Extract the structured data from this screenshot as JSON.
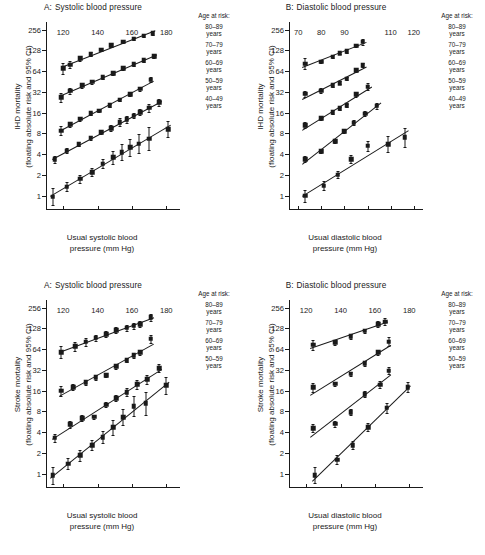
{
  "figure": {
    "legend_title": "Age at risk:",
    "axis_note": "floating absolute risk and 95% CI"
  },
  "chart_data": [
    {
      "id": "ihd-systolic",
      "type": "scatter",
      "panel_letter": "A:",
      "title": "Systolic blood pressure",
      "xlabel_line1": "Usual systolic blood",
      "xlabel_line2": "pressure (mm Hg)",
      "ylabel_line1": "IHD mortality",
      "ylabel_line2": "(floating absolute risk and 95% CI)",
      "yscale": "log2",
      "yticks": [
        1,
        2,
        4,
        8,
        16,
        32,
        64,
        128,
        256
      ],
      "ylim": [
        0.62,
        330
      ],
      "xticks": [
        120,
        140,
        160,
        180
      ],
      "xlim": [
        110,
        188
      ],
      "legend_title": "Age at risk:",
      "grid": false,
      "legend_position": "right",
      "series": [
        {
          "name": "80-89 years",
          "label_line1": "80–89",
          "label_line2": "years",
          "x": [
            120,
            124,
            130,
            136,
            142,
            148,
            155,
            161,
            167,
            172
          ],
          "y": [
            70,
            79,
            98,
            113,
            131,
            152,
            172,
            190,
            208,
            228
          ],
          "ci_lo": [
            58,
            70,
            90,
            106,
            124,
            145,
            165,
            182,
            198,
            216
          ],
          "ci_hi": [
            85,
            89,
            107,
            120,
            139,
            160,
            180,
            199,
            219,
            241
          ]
        },
        {
          "name": "70-79 years",
          "label_line1": "70–79",
          "label_line2": "years",
          "x": [
            119,
            124,
            131,
            137,
            143,
            149,
            155,
            161,
            167,
            173
          ],
          "y": [
            27,
            33,
            40,
            45,
            52,
            60,
            70,
            80,
            92,
            105
          ],
          "ci_lo": [
            23,
            30,
            37,
            42,
            49,
            57,
            67,
            77,
            88,
            100
          ],
          "ci_hi": [
            31,
            36,
            43,
            48,
            55,
            63,
            73,
            83,
            96,
            110
          ]
        },
        {
          "name": "60-69 years",
          "label_line1": "60–69",
          "label_line2": "years",
          "x": [
            119,
            124,
            130,
            136,
            141,
            147,
            153,
            159,
            165,
            171
          ],
          "y": [
            8.8,
            10.8,
            13.0,
            15.8,
            17.0,
            20.5,
            24.5,
            29.5,
            35.5,
            48
          ],
          "ci_lo": [
            7.6,
            10.0,
            12.3,
            15.0,
            16.3,
            19.6,
            23.4,
            28.0,
            33.2,
            44
          ],
          "ci_hi": [
            10.1,
            11.6,
            13.7,
            16.6,
            17.8,
            21.4,
            25.6,
            31.0,
            38.0,
            52
          ]
        },
        {
          "name": "50-59 years",
          "label_line1": "50–59",
          "label_line2": "years",
          "x": [
            115,
            122,
            129,
            136,
            142,
            148,
            153,
            157,
            161,
            165,
            170,
            176
          ],
          "y": [
            3.4,
            4.5,
            5.6,
            6.9,
            8.3,
            9.5,
            11.6,
            12.8,
            14.5,
            16.2,
            18.8,
            22.5
          ],
          "ci_lo": [
            3.0,
            4.1,
            5.2,
            6.5,
            7.8,
            8.6,
            10.2,
            11.4,
            13.2,
            14.6,
            16.6,
            19.8
          ],
          "ci_hi": [
            3.8,
            4.9,
            6.0,
            7.3,
            8.8,
            10.5,
            13.2,
            14.4,
            16.0,
            18.0,
            21.3,
            25.6
          ]
        },
        {
          "name": "40-49 years",
          "label_line1": "40–49",
          "label_line2": "years",
          "x": [
            114,
            122,
            130,
            137,
            143,
            149,
            154,
            159,
            164,
            170,
            181
          ],
          "y": [
            0.97,
            1.35,
            1.75,
            2.2,
            2.9,
            3.6,
            4.3,
            5.0,
            5.7,
            6.7,
            9.2
          ],
          "ci_lo": [
            0.74,
            1.15,
            1.55,
            1.95,
            2.5,
            2.9,
            3.3,
            3.8,
            4.1,
            4.6,
            7.0
          ],
          "ci_hi": [
            1.28,
            1.6,
            1.98,
            2.5,
            3.4,
            4.5,
            5.6,
            6.6,
            7.9,
            9.8,
            12.1
          ]
        }
      ]
    },
    {
      "id": "ihd-diastolic",
      "type": "scatter",
      "panel_letter": "B:",
      "title": "Diastolic blood pressure",
      "xlabel_line1": "Usual diastolic blood",
      "xlabel_line2": "pressure (mm Hg)",
      "ylabel_line1": "IHD mortality",
      "ylabel_line2": "(floating absolute risk and 95% CI)",
      "yscale": "log2",
      "yticks": [
        1,
        2,
        4,
        8,
        16,
        32,
        64,
        128,
        256
      ],
      "ylim": [
        0.62,
        330
      ],
      "xticks": [
        70,
        80,
        90,
        110,
        120
      ],
      "xtick_positions": [
        70,
        80,
        90,
        110,
        120
      ],
      "xlim": [
        66,
        124
      ],
      "legend_title": "Age at risk:",
      "grid": false,
      "legend_position": "right",
      "series": [
        {
          "name": "80-89 years",
          "label_line1": "80–89",
          "label_line2": "years",
          "x": [
            73,
            80,
            85,
            88,
            91,
            95,
            98
          ],
          "y": [
            82,
            88,
            104,
            117,
            125,
            150,
            170
          ],
          "ci_lo": [
            68,
            83,
            99,
            112,
            119,
            142,
            155
          ],
          "ci_hi": [
            98,
            94,
            110,
            123,
            132,
            159,
            187
          ]
        },
        {
          "name": "70-79 years",
          "label_line1": "70–79",
          "label_line2": "years",
          "x": [
            73,
            80,
            85,
            88,
            91,
            95,
            98
          ],
          "y": [
            30,
            33,
            40,
            43,
            50,
            66,
            78
          ],
          "ci_lo": [
            27,
            31,
            38,
            41,
            47,
            62,
            73
          ],
          "ci_hi": [
            33,
            36,
            43,
            46,
            53,
            70,
            84
          ]
        },
        {
          "name": "60-69 years",
          "label_line1": "60–69",
          "label_line2": "years",
          "x": [
            73,
            80,
            85,
            88,
            91,
            95,
            100
          ],
          "y": [
            10.5,
            13.2,
            16.3,
            18.5,
            20.5,
            29.5,
            38
          ],
          "ci_lo": [
            9.5,
            12.4,
            15.4,
            17.5,
            19.4,
            27.4,
            34
          ],
          "ci_hi": [
            11.7,
            14.1,
            17.3,
            19.6,
            21.7,
            31.8,
            43
          ]
        },
        {
          "name": "50-59 years",
          "label_line1": "50–59",
          "label_line2": "years",
          "x": [
            73,
            80,
            86,
            90,
            94,
            99,
            104
          ],
          "y": [
            3.4,
            4.4,
            6.2,
            8.6,
            11.5,
            15.5,
            20
          ],
          "ci_lo": [
            3.1,
            4.1,
            5.8,
            8.0,
            10.6,
            14.2,
            18.2
          ],
          "ci_hi": [
            3.8,
            4.8,
            6.6,
            9.2,
            12.4,
            17.0,
            22.1
          ]
        },
        {
          "name": "40-49 years",
          "label_line1": "40–49",
          "label_line2": "years",
          "x": [
            73,
            81,
            87,
            93,
            100,
            109,
            116
          ],
          "y": [
            1.0,
            1.4,
            2.0,
            3.4,
            5.3,
            5.6,
            7.0
          ],
          "ci_lo": [
            0.82,
            1.22,
            1.78,
            3.0,
            4.4,
            4.3,
            5.1
          ],
          "ci_hi": [
            1.22,
            1.62,
            2.26,
            3.9,
            6.3,
            7.3,
            9.7
          ]
        }
      ]
    },
    {
      "id": "stroke-systolic",
      "type": "scatter",
      "panel_letter": "A:",
      "title": "Systolic blood pressure",
      "xlabel_line1": "Usual systolic blood",
      "xlabel_line2": "pressure (mm Hg)",
      "ylabel_line1": "Stroke mortality",
      "ylabel_line2": "(floating absolute risk and 95% CI)",
      "yscale": "log2",
      "yticks": [
        1,
        2,
        4,
        8,
        16,
        32,
        64,
        128,
        256
      ],
      "ylim": [
        0.62,
        330
      ],
      "xticks": [
        120,
        140,
        160,
        180
      ],
      "xlim": [
        110,
        188
      ],
      "legend_title": "Age at risk:",
      "grid": false,
      "legend_position": "right",
      "series": [
        {
          "name": "80-89 years",
          "label_line1": "80–89",
          "label_line2": "years",
          "x": [
            119,
            127,
            133,
            139,
            145,
            151,
            157,
            161,
            165,
            171
          ],
          "y": [
            58,
            70,
            82,
            93,
            106,
            120,
            131,
            140,
            148,
            185
          ],
          "ci_lo": [
            48,
            60,
            72,
            83,
            96,
            109,
            119,
            127,
            133,
            165
          ],
          "ci_hi": [
            70,
            81,
            93,
            104,
            117,
            132,
            144,
            154,
            164,
            207
          ]
        },
        {
          "name": "70-79 years",
          "label_line1": "70–79",
          "label_line2": "years",
          "x": [
            119,
            126,
            133,
            139,
            145,
            151,
            157,
            161,
            165,
            171
          ],
          "y": [
            16,
            18,
            21,
            25,
            27,
            36,
            44,
            52,
            58,
            90
          ],
          "ci_lo": [
            13.5,
            16.5,
            19.5,
            23.2,
            25.2,
            33.5,
            41,
            48,
            53,
            78
          ],
          "ci_hi": [
            18.8,
            19.7,
            22.6,
            27,
            29,
            38.7,
            47,
            56,
            63,
            104
          ]
        },
        {
          "name": "60-69 years",
          "label_line1": "60–69",
          "label_line2": "years",
          "x": [
            115,
            124,
            131,
            138,
            145,
            151,
            157,
            163,
            169,
            176
          ],
          "y": [
            3.3,
            5.2,
            6.4,
            6.7,
            10.0,
            12.4,
            15.2,
            19.8,
            23.5,
            34
          ],
          "ci_lo": [
            2.9,
            4.6,
            5.9,
            6.3,
            9.2,
            11.2,
            13.3,
            17.1,
            20.2,
            29.5
          ],
          "ci_hi": [
            3.8,
            5.9,
            7.0,
            7.2,
            10.9,
            13.7,
            17.4,
            22.9,
            27.4,
            39
          ]
        },
        {
          "name": "50-59 years",
          "label_line1": "50–59",
          "label_line2": "years",
          "x": [
            114,
            123,
            130,
            137,
            143,
            149,
            155,
            161,
            168,
            180
          ],
          "y": [
            0.95,
            1.4,
            1.85,
            2.6,
            3.4,
            4.7,
            6.6,
            9.5,
            10.5,
            19
          ],
          "ci_lo": [
            0.72,
            1.18,
            1.55,
            2.2,
            2.8,
            3.6,
            5.0,
            6.8,
            7.2,
            14.5
          ],
          "ci_hi": [
            1.26,
            1.68,
            2.2,
            3.1,
            4.1,
            6.1,
            8.7,
            13.3,
            15.3,
            25
          ]
        }
      ]
    },
    {
      "id": "stroke-diastolic",
      "type": "scatter",
      "panel_letter": "B:",
      "title": "Diastolic blood pressure",
      "xlabel_line1": "Usual diastolic blood",
      "xlabel_line2": "pressure (mm Hg)",
      "ylabel_line1": "Stroke mortality",
      "ylabel_line2": "(floating absolute risk and 95% CI)",
      "yscale": "log2",
      "yticks": [
        1,
        2,
        4,
        8,
        16,
        32,
        64,
        128,
        256
      ],
      "ylim": [
        0.62,
        330
      ],
      "xticks": [
        120,
        140,
        160,
        180
      ],
      "xlim": [
        110,
        188
      ],
      "legend_title": "Age at risk:",
      "grid": false,
      "legend_position": "right",
      "series": [
        {
          "name": "80-89 years",
          "label_line1": "80–89",
          "label_line2": "years",
          "x": [
            124,
            137,
            146,
            154,
            162,
            166
          ],
          "y": [
            74,
            80,
            98,
            118,
            148,
            160
          ],
          "ci_lo": [
            62,
            73,
            91,
            110,
            134,
            144
          ],
          "ci_hi": [
            88,
            88,
            106,
            127,
            163,
            178
          ]
        },
        {
          "name": "70-79 years",
          "label_line1": "70–79",
          "label_line2": "years",
          "x": [
            124,
            137,
            146,
            154,
            162,
            168
          ],
          "y": [
            18,
            20,
            28,
            40,
            58,
            82
          ],
          "ci_lo": [
            15.5,
            18.5,
            26,
            37,
            53,
            70
          ],
          "ci_hi": [
            20.9,
            21.7,
            30.2,
            43.2,
            63,
            96
          ]
        },
        {
          "name": "60-69 years",
          "label_line1": "60–69",
          "label_line2": "years",
          "x": [
            124,
            137,
            146,
            154,
            163,
            168
          ],
          "y": [
            4.6,
            5.3,
            7.8,
            14.2,
            19.5,
            31
          ],
          "ci_lo": [
            4.0,
            4.8,
            7.1,
            13.0,
            17.5,
            27.5
          ],
          "ci_hi": [
            5.3,
            5.9,
            8.6,
            15.6,
            21.8,
            35
          ]
        },
        {
          "name": "50-59 years",
          "label_line1": "50–59",
          "label_line2": "years",
          "x": [
            125,
            138,
            147,
            156,
            167,
            179
          ],
          "y": [
            0.95,
            1.6,
            2.6,
            4.7,
            9.0,
            18
          ],
          "ci_lo": [
            0.74,
            1.38,
            2.25,
            4.1,
            7.6,
            15.2
          ],
          "ci_hi": [
            1.25,
            1.88,
            3.0,
            5.4,
            10.7,
            21.5
          ]
        }
      ]
    }
  ]
}
